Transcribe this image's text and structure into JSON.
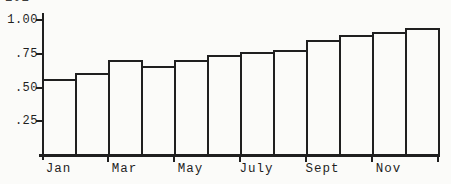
{
  "page": {
    "background_color": "#fbfbf9",
    "ink_color": "#1f1f1f",
    "top_left_cropped_text": "101"
  },
  "chart_data": {
    "type": "bar",
    "title": "",
    "xlabel": "",
    "ylabel": "",
    "categories": [
      "Jan",
      "Feb",
      "Mar",
      "Apr",
      "May",
      "Jun",
      "Jul",
      "Aug",
      "Sep",
      "Oct",
      "Nov",
      "Dec"
    ],
    "values": [
      0.56,
      0.61,
      0.7,
      0.66,
      0.7,
      0.74,
      0.76,
      0.78,
      0.85,
      0.89,
      0.91,
      0.94
    ],
    "ylim": [
      0,
      1.0
    ],
    "grid": false,
    "legend": false,
    "bar_gap": 0,
    "bar_fill": "#fbfbf9",
    "bar_outline": "#1f1f1f",
    "y_ticks": [
      {
        "label": "1.00",
        "value": 1.0
      },
      {
        "label": ".75",
        "value": 0.75
      },
      {
        "label": ".50",
        "value": 0.5
      },
      {
        "label": ".25",
        "value": 0.25
      }
    ],
    "x_axis_labels": [
      {
        "label": "Jan",
        "bar_index": 0
      },
      {
        "label": "Mar",
        "bar_index": 2
      },
      {
        "label": "May",
        "bar_index": 4
      },
      {
        "label": "July",
        "bar_index": 6
      },
      {
        "label": "Sept",
        "bar_index": 8
      },
      {
        "label": "Nov",
        "bar_index": 10
      }
    ],
    "x_ticks_every_n_bars": 2
  }
}
